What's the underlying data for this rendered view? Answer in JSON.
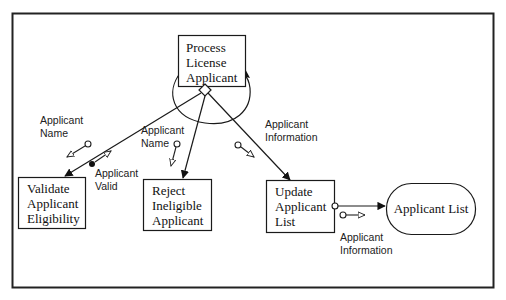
{
  "diagram": {
    "type": "structure-chart",
    "modules": {
      "process": {
        "lines": [
          "Process",
          "License",
          "Applicant"
        ]
      },
      "validate": {
        "lines": [
          "Validate",
          "Applicant",
          "Eligibility"
        ]
      },
      "reject": {
        "lines": [
          "Reject",
          "Ineligible",
          "Applicant"
        ]
      },
      "update": {
        "lines": [
          "Update",
          "Applicant",
          "List"
        ]
      }
    },
    "datastore": {
      "label": "Applicant List"
    },
    "couples": {
      "validate_in": {
        "lines": [
          "Applicant",
          "Name"
        ],
        "kind": "data"
      },
      "validate_out": {
        "lines": [
          "Applicant",
          "Valid"
        ],
        "kind": "control"
      },
      "reject_in": {
        "lines": [
          "Applicant",
          "Name"
        ],
        "kind": "data"
      },
      "update_in": {
        "lines": [
          "Applicant",
          "Information"
        ],
        "kind": "data"
      },
      "store_out": {
        "lines": [
          "Applicant",
          "Information"
        ],
        "kind": "data"
      }
    },
    "annotations": {
      "loop": "loop-arc",
      "decision": "diamond"
    },
    "colors": {
      "line": "#1a1a1a",
      "frame": "#222222",
      "background": "#ffffff"
    }
  }
}
